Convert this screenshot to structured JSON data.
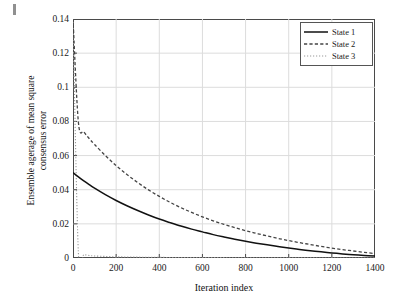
{
  "figure": {
    "background_color": "#ffffff",
    "frame_color": "#4a4a4a",
    "grid_color": "#dcdcdc"
  },
  "axis": {
    "x_title": "Iteration index",
    "y_title_line1": "Ensemble agerage of mean square",
    "y_title_line2": "consensus error",
    "x_ticks": [
      "0",
      "200",
      "400",
      "600",
      "800",
      "1000",
      "1200",
      "1400"
    ],
    "y_ticks": [
      "0",
      "0.02",
      "0.04",
      "0.06",
      "0.08",
      "0.1",
      "0.12",
      "0.14"
    ]
  },
  "legend": {
    "position": "top-right",
    "items": [
      {
        "label": "State 1",
        "style": "solid",
        "color": "#111111",
        "icon": "solid-line-swatch-icon"
      },
      {
        "label": "State 2",
        "style": "dashed",
        "color": "#444444",
        "icon": "dashed-line-swatch-icon"
      },
      {
        "label": "State 3",
        "style": "dotted",
        "color": "#9a9a9a",
        "icon": "dotted-line-swatch-icon"
      }
    ]
  },
  "chart_data": {
    "type": "line",
    "title": "",
    "xlabel": "Iteration index",
    "ylabel": "Ensemble agerage of mean square consensus error",
    "xlim": [
      0,
      1400
    ],
    "ylim": [
      0,
      0.14
    ],
    "xticks": [
      0,
      200,
      400,
      600,
      800,
      1000,
      1200,
      1400
    ],
    "yticks": [
      0,
      0.02,
      0.04,
      0.06,
      0.08,
      0.1,
      0.12,
      0.14
    ],
    "grid": true,
    "legend_position": "upper right",
    "x": [
      0,
      25,
      50,
      75,
      100,
      150,
      200,
      250,
      300,
      350,
      400,
      450,
      500,
      550,
      600,
      650,
      700,
      750,
      800,
      850,
      900,
      950,
      1000,
      1050,
      1100,
      1150,
      1200,
      1250,
      1300,
      1350,
      1400
    ],
    "series": [
      {
        "name": "State 1",
        "style": "solid",
        "color": "#111111",
        "values": [
          0.05,
          0.0475,
          0.0452,
          0.043,
          0.0409,
          0.0371,
          0.0337,
          0.0306,
          0.0278,
          0.0252,
          0.0228,
          0.0207,
          0.0187,
          0.0169,
          0.0153,
          0.0137,
          0.0123,
          0.011,
          0.0098,
          0.0087,
          0.0077,
          0.0067,
          0.0058,
          0.005,
          0.0043,
          0.0036,
          0.003,
          0.0024,
          0.0019,
          0.0015,
          0.0011
        ]
      },
      {
        "name": "State 2",
        "style": "dashed",
        "color": "#444444",
        "values": [
          0.14,
          0.0795,
          0.074,
          0.07,
          0.0665,
          0.06,
          0.0541,
          0.0489,
          0.0442,
          0.0399,
          0.0361,
          0.0326,
          0.0295,
          0.0267,
          0.0241,
          0.0218,
          0.0197,
          0.0178,
          0.016,
          0.0144,
          0.0129,
          0.0115,
          0.0102,
          0.009,
          0.0079,
          0.0068,
          0.0058,
          0.0049,
          0.0041,
          0.0033,
          0.0026
        ]
      },
      {
        "name": "State 3",
        "style": "dotted",
        "color": "#9a9a9a",
        "values": [
          0.14,
          0.003,
          0.002,
          0.0015,
          0.0012,
          0.0009,
          0.0007,
          0.0006,
          0.0005,
          0.0004,
          0.0004,
          0.0003,
          0.0003,
          0.0002,
          0.0002,
          0.0002,
          0.0002,
          0.0001,
          0.0001,
          0.0001,
          0.0001,
          0.0001,
          0.0001,
          0.0001,
          0.0001,
          0.0,
          0.0,
          0.0,
          0.0,
          0.0,
          0.0
        ]
      }
    ]
  }
}
